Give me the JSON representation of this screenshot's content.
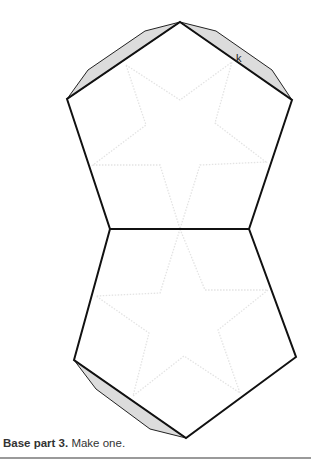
{
  "figure": {
    "caption_bold": "Base part 3.",
    "caption_text": " Make one.",
    "tab_label": "k",
    "colors": {
      "outline": "#111111",
      "tab_fill": "#dcdcdc",
      "star_dotted": "#e6e6e6",
      "rule": "#9a9a9a"
    },
    "upper_pentagon": "180,22 292,100 249,229 110,229 67,99",
    "lower_pentagon": "110,229 249,229 296,357 186,438 74,360",
    "tabs": [
      "67,99 88,70 145,31 180,22",
      "180,22 216,31 272,70 292,100",
      "74,360 96,389 150,429 186,438"
    ],
    "upper_star": "126,65 180,100 232,62 215,123 266,162 200,165 180,229 160,165 93,165 146,125",
    "lower_star": "180,229 205,290 268,290 218,330 240,393 184,356 133,396 149,333 96,296 160,293"
  }
}
